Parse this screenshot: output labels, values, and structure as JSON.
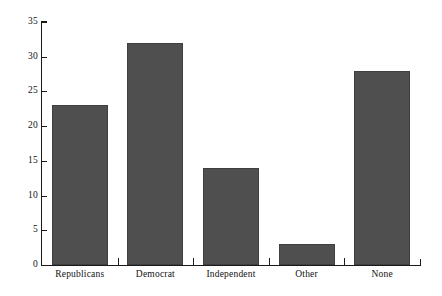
{
  "chart_data": {
    "type": "bar",
    "title": "",
    "xlabel": "",
    "ylabel": "",
    "categories": [
      "Republicans",
      "Democrat",
      "Independent",
      "Other",
      "None"
    ],
    "values": [
      23,
      32,
      14,
      3,
      28
    ],
    "ylim": [
      0,
      35
    ],
    "yticks": [
      0,
      5,
      10,
      15,
      20,
      25,
      30,
      35
    ],
    "ytick_labels": [
      "0",
      "5",
      "10",
      "15",
      "20",
      "25",
      "30",
      "35"
    ],
    "grid": false,
    "legend": false,
    "legend_position": "none",
    "bar_color": "#4f4f4f",
    "axis_color": "#1a1a1a",
    "background_color": "#ffffff"
  }
}
